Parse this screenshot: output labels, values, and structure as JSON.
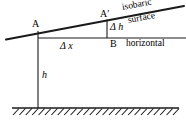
{
  "diagram": {
    "labels": {
      "point_a": "A",
      "point_a_prime": "A′",
      "point_b": "B",
      "delta_h": "Δ h",
      "delta_x": "Δ x",
      "height_h": "h",
      "isobaric": "isobaric",
      "surface": "surface",
      "horizontal": "horizontal"
    },
    "colors": {
      "ink": "#1a1a1a",
      "background": "#ffffff"
    },
    "geometry": {
      "isobaric_line": {
        "x1": 6,
        "y1": 39,
        "x2": 184,
        "y2": 6
      },
      "horizontal_line": {
        "x1": 38,
        "y1": 38,
        "x2": 186,
        "y2": 38
      },
      "delta_h_segment": {
        "x": 107,
        "y1": 20,
        "y2": 38
      },
      "height_segment": {
        "x": 38,
        "y1": 31,
        "y2": 108
      },
      "ground_line": {
        "x1": 12,
        "y": 108,
        "x2": 179
      },
      "hatch_count": 26
    }
  }
}
